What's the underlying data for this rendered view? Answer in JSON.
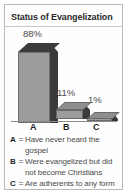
{
  "panel": {
    "title": "Status of Evangelization",
    "background_color": "#fefefe",
    "border_color": "#b9b9b9"
  },
  "chart_data": {
    "type": "bar",
    "title": "Status of Evangelization",
    "categories": [
      "A",
      "B",
      "C"
    ],
    "values": [
      88,
      11,
      1
    ],
    "value_labels": [
      "88%",
      "11%",
      "1%"
    ],
    "xlabel": "",
    "ylabel": "",
    "ylim": [
      0,
      100
    ],
    "grid": false,
    "legend_position": "below",
    "style": "3d-bar",
    "bar_face_color": "#9c9c9c",
    "bar_shadow_color": "#3a3a3a",
    "legend": [
      {
        "key": "A",
        "separator": "=",
        "text": "Have never heard the gospel"
      },
      {
        "key": "B",
        "separator": "=",
        "text": "Were evangelized but did not become Christians"
      },
      {
        "key": "C",
        "separator": "=",
        "text": "Are adherents to any form of Christianity"
      }
    ]
  }
}
